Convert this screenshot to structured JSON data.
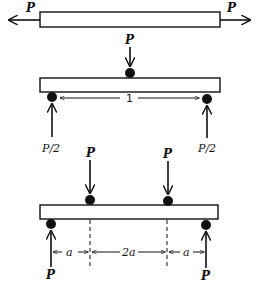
{
  "figure": {
    "panels": [
      {
        "name": "axial-tension",
        "labels": {
          "left_force": "P",
          "right_force": "P"
        }
      },
      {
        "name": "three-point-bending",
        "labels": {
          "load": "P",
          "span": "1",
          "left_reaction": "P/2",
          "right_reaction": "P/2"
        }
      },
      {
        "name": "four-point-bending",
        "labels": {
          "left_load": "P",
          "right_load": "P",
          "left_reaction": "P",
          "right_reaction": "P",
          "dim_left": "a",
          "dim_middle": "2a",
          "dim_right": "a"
        }
      }
    ],
    "colors": {
      "ink": "#111111",
      "background": "#ffffff"
    }
  }
}
